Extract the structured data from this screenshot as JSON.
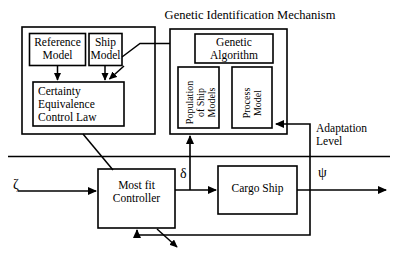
{
  "diagram": {
    "title": "Genetic Identification Mechanism",
    "stroke_color": "#000000",
    "background_color": "#ffffff",
    "boxes": {
      "reference_model": "Reference\nModel",
      "ship_model": "Ship\nModel",
      "certainty_equivalence": "Certainty\nEquivalence\nControl Law",
      "genetic_algorithm": "Genetic\nAlgorithm",
      "population_of_ship_models": "Population\nof Ship\nModels",
      "process_model": "Process\nModel",
      "most_fit_controller": "Most fit\nController",
      "cargo_ship": "Cargo Ship"
    },
    "annotations": {
      "adaptation_level": "Adaptation\nLevel",
      "input_signal": "ζ",
      "rudder_signal": "δ",
      "heading_output": "ψ"
    }
  }
}
